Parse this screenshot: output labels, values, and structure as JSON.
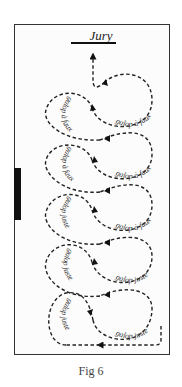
{
  "figure": {
    "title": "Jury",
    "caption": "Fig 6",
    "line_color": "#222222",
    "frame_color": "#333333",
    "marker_color": "#111111"
  },
  "loops": {
    "right": [
      {
        "label": "galop à faux"
      },
      {
        "label": "galop à faux"
      },
      {
        "label": "galop à faux"
      },
      {
        "label": "galop juste"
      },
      {
        "label": "galop juste"
      }
    ],
    "left": [
      {
        "label": "galop à faux"
      },
      {
        "label": "galop à faux"
      },
      {
        "label": "galop juste"
      },
      {
        "label": "galop juste"
      },
      {
        "label": "galop juste"
      }
    ]
  }
}
